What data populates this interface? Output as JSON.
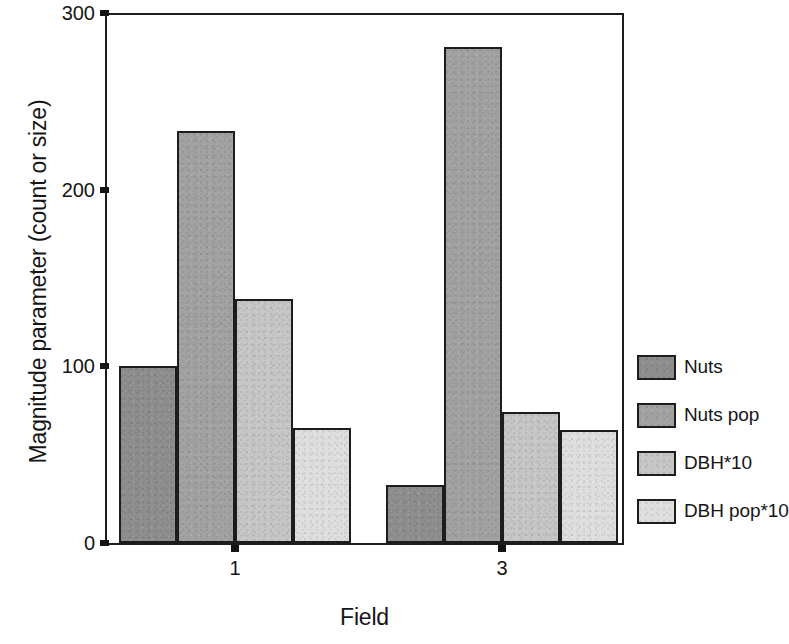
{
  "chart_data": {
    "type": "bar",
    "title": "",
    "xlabel": "Field",
    "ylabel": "Magnitude parameter (count or size)",
    "categories": [
      "1",
      "3"
    ],
    "series": [
      {
        "name": "Nuts",
        "values": [
          100,
          33
        ],
        "color": "#8e8e8e"
      },
      {
        "name": "Nuts pop",
        "values": [
          233,
          281
        ],
        "color": "#a2a2a2"
      },
      {
        "name": "DBH*10",
        "values": [
          138,
          74
        ],
        "color": "#c6c6c6"
      },
      {
        "name": "DBH pop*10",
        "values": [
          65,
          64
        ],
        "color": "#dedede"
      }
    ],
    "ylim": [
      0,
      300
    ],
    "yticks": [
      0,
      100,
      200,
      300
    ],
    "ytick_labels": [
      "0",
      "100",
      "200",
      "300"
    ],
    "xtick_labels": [
      "1",
      "3"
    ],
    "grid": false,
    "legend_position": "right",
    "grouped": true,
    "bar_edge_color": "#1d1d1d",
    "background_color": "#ffffff"
  },
  "legend": {
    "entries": [
      {
        "label": "Nuts"
      },
      {
        "label": "Nuts pop"
      },
      {
        "label": "DBH*10"
      },
      {
        "label": "DBH pop*10"
      }
    ]
  },
  "axes": {
    "y_title": "Magnitude parameter (count or size)",
    "x_title": "Field"
  }
}
